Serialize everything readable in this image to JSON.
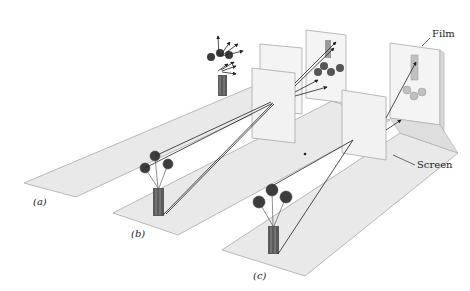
{
  "figure": {
    "panels": [
      {
        "id": "a",
        "label": "(a)",
        "description": "Object (vase of flowers) emitting light in all directions toward a film; no image formed"
      },
      {
        "id": "b",
        "label": "(b)",
        "description": "Opaque screen with a small aperture placed between the object and the film; rays pass through the hole forming an inverted image"
      },
      {
        "id": "c",
        "label": "(c)",
        "description": "Pinhole camera arrangement; rays through a pinhole in the screen produce a faint inverted image on the film"
      }
    ],
    "callouts": {
      "film": "Film",
      "screen": "Screen"
    },
    "colors": {
      "floor": "#e6e6e6",
      "panel": "#f4f4f4",
      "edge": "#9a9a9a",
      "ray": "#222222",
      "flower": "#3c3c3c",
      "vase": "#555555",
      "image_faded": "#b8b8b8"
    }
  }
}
